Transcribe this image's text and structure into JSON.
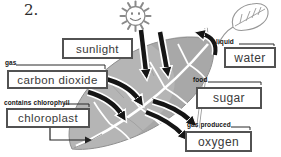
{
  "figure_number": "2.",
  "nodes": [
    {
      "id": "sunlight",
      "tag": "",
      "label": "sunlight"
    },
    {
      "id": "carbon-dioxide",
      "tag": "gas",
      "label": "carbon dioxide"
    },
    {
      "id": "chloroplast",
      "tag": "contains chlorophyll",
      "label": "chloroplast"
    },
    {
      "id": "water",
      "tag": "liquid",
      "label": "water"
    },
    {
      "id": "sugar",
      "tag": "food",
      "label": "sugar"
    },
    {
      "id": "oxygen",
      "tag": "gas produced",
      "label": "oxygen"
    }
  ],
  "flows": [
    {
      "from": "sun",
      "to": "leaf",
      "arrows": 2
    },
    {
      "from": "carbon dioxide",
      "to": "leaf",
      "arrows": 2
    },
    {
      "from": "water",
      "to": "leaf stem",
      "arrows": 1
    },
    {
      "from": "leaf",
      "to": "oxygen",
      "arrows": 2
    },
    {
      "from": "chloroplast",
      "to": "leaf",
      "arrows": 1
    }
  ],
  "icons": {
    "sun": "sun-icon",
    "leaf": "leaf-icon",
    "leaf_sketch": "leaf-sketch-icon"
  },
  "colors": {
    "background": "#ffffff",
    "leaf_fill": "#b5b5b5",
    "leaf_shade": "#9a9a9a",
    "vein": "#ffffff",
    "arrow_fill": "#151515",
    "arrow_outline": "#ffffff",
    "box_border": "#525252",
    "box_text": "#3a3a3a",
    "sketch_stroke": "#979797"
  }
}
